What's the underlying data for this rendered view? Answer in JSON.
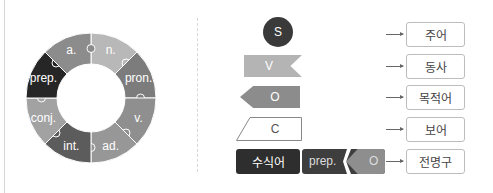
{
  "ring": {
    "segments": [
      {
        "label": "n.",
        "color": "#b8b8b8"
      },
      {
        "label": "pron.",
        "color": "#7c7c7c"
      },
      {
        "label": "v.",
        "color": "#8f8f8f"
      },
      {
        "label": "ad.",
        "color": "#979797"
      },
      {
        "label": "int.",
        "color": "#5c5c5c"
      },
      {
        "label": "conj.",
        "color": "#a2a2a2"
      },
      {
        "label": "prep.",
        "color": "#262626"
      },
      {
        "label": "a.",
        "color": "#8c8c8c"
      }
    ]
  },
  "elements": {
    "subject_symbol": "S",
    "verb_symbol": "V",
    "object_symbol": "O",
    "complement_symbol": "C",
    "modifier_label": "수식어",
    "prep_label": "prep.",
    "prep_object_symbol": "O"
  },
  "meanings": [
    {
      "label": "주어"
    },
    {
      "label": "동사"
    },
    {
      "label": "목적어"
    },
    {
      "label": "보어"
    },
    {
      "label": "전명구"
    }
  ]
}
